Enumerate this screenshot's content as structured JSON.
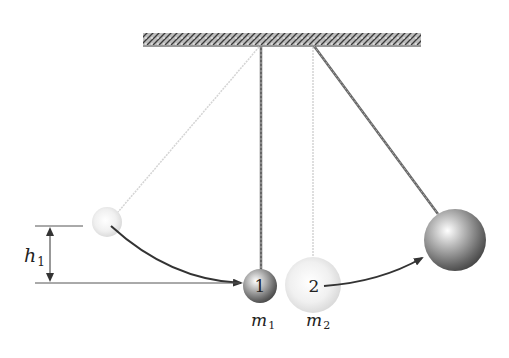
{
  "diagram": {
    "labels": {
      "height": "h",
      "height_sub": "1",
      "mass1": "m",
      "mass1_sub": "1",
      "mass2": "m",
      "mass2_sub": "2",
      "ball1_number": "1",
      "ball2_number": "2"
    },
    "colors": {
      "ceiling": "#555555",
      "string": "#666666",
      "ghost": "#dddddd",
      "arrow": "#333333",
      "ball_light": "#ffffff",
      "ball_dark": "#555555"
    }
  }
}
